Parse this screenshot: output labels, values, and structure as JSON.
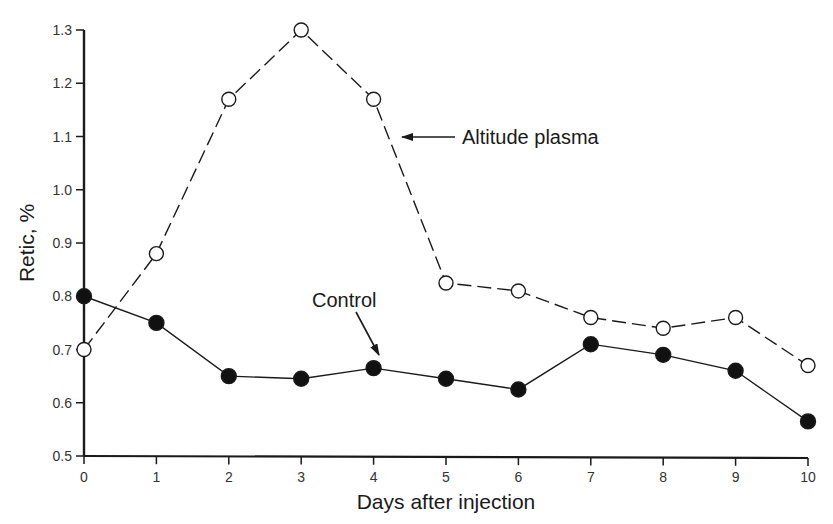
{
  "chart_data": {
    "type": "line",
    "title": "",
    "xlabel": "Days after injection",
    "ylabel": "Retic, %",
    "xlim": [
      0,
      10
    ],
    "ylim": [
      0.5,
      1.3
    ],
    "x": [
      0,
      1,
      2,
      3,
      4,
      5,
      6,
      7,
      8,
      9,
      10
    ],
    "x_tick_labels": [
      "0",
      "1",
      "2",
      "3",
      "4",
      "5",
      "6",
      "7",
      "8",
      "9",
      "10"
    ],
    "y_ticks": [
      0.5,
      0.6,
      0.7,
      0.8,
      0.9,
      1.0,
      1.1,
      1.2,
      1.3
    ],
    "y_tick_labels": [
      "0.5",
      "0.6",
      "0.7",
      "0.8",
      "0.9",
      "1.0",
      "1.1",
      "1.2",
      "1.3"
    ],
    "grid": false,
    "legend": "none (inline annotations with arrows)",
    "series": [
      {
        "name": "Altitude plasma",
        "style": "dashed line, open circles",
        "values": [
          0.7,
          0.88,
          1.17,
          1.3,
          1.17,
          0.825,
          0.81,
          0.76,
          0.74,
          0.76,
          0.67
        ]
      },
      {
        "name": "Control",
        "style": "solid line, filled circles",
        "values": [
          0.8,
          0.75,
          0.65,
          0.645,
          0.665,
          0.645,
          0.625,
          0.71,
          0.69,
          0.66,
          0.565
        ]
      }
    ],
    "annotations": [
      {
        "text": "Altitude plasma",
        "points_to": "Altitude plasma series near day 4.3"
      },
      {
        "text": "Control",
        "points_to": "Control series at day 4"
      }
    ]
  }
}
